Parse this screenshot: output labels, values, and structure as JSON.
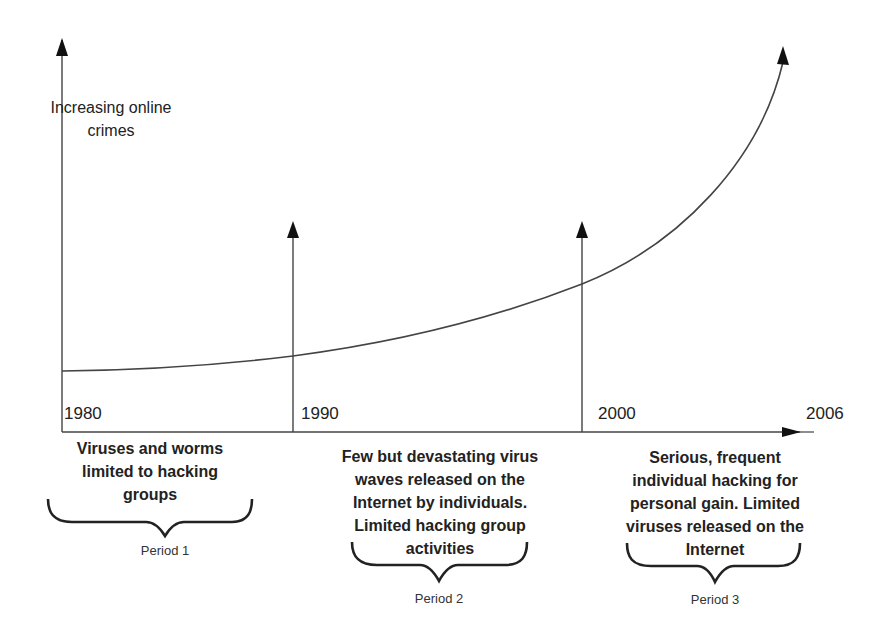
{
  "diagram": {
    "y_axis_label_line1": "Increasing online",
    "y_axis_label_line2": "crimes",
    "years": [
      "1980",
      "1990",
      "2000",
      "2006"
    ],
    "periods": [
      {
        "name": "Period 1",
        "description_lines": [
          "Viruses and worms",
          "limited to hacking",
          "groups"
        ]
      },
      {
        "name": "Period 2",
        "description_lines": [
          "Few but devastating virus",
          "waves released on the",
          "Internet by individuals.",
          "Limited hacking group",
          "activities"
        ]
      },
      {
        "name": "Period 3",
        "description_lines": [
          "Serious, frequent",
          "individual hacking for",
          "personal gain. Limited",
          "viruses released on the",
          "Internet"
        ]
      }
    ],
    "colors": {
      "line": "#444444",
      "arrowhead": "#111111",
      "text": "#222222",
      "background": "#ffffff"
    }
  }
}
